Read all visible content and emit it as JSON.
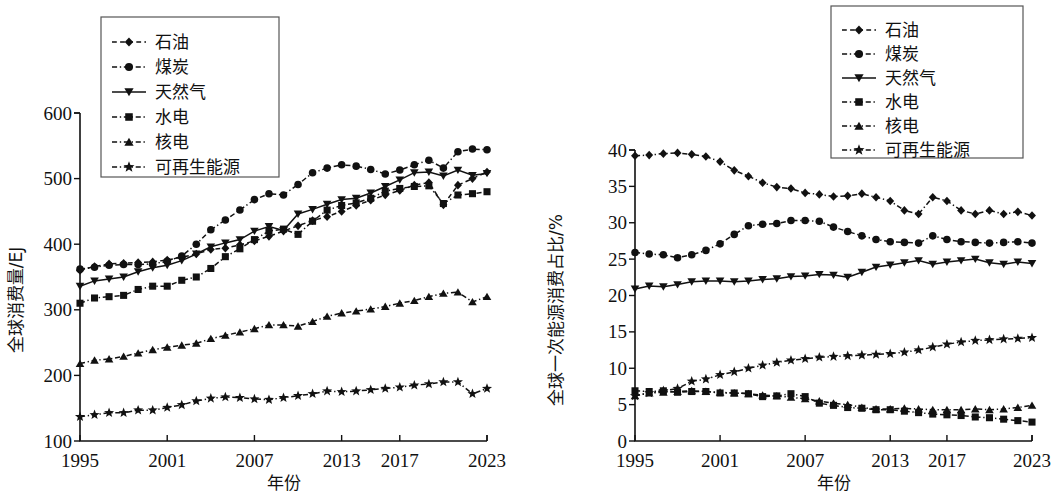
{
  "figure": {
    "panels": [
      "left",
      "right"
    ],
    "shared_xlabel": "年份",
    "xticks": [
      "1995",
      "2001",
      "2007",
      "2013",
      "2017",
      "2023"
    ],
    "series_names": [
      "石油",
      "煤炭",
      "天然气",
      "水电",
      "核电",
      "可再生能源"
    ],
    "marker_glyphs": [
      "diamond",
      "circle",
      "triangle-down",
      "square",
      "triangle-up",
      "star"
    ]
  },
  "legend": {
    "title": "",
    "items": [
      {
        "label": "石油",
        "marker": "diamond",
        "dash": "dashed"
      },
      {
        "label": "煤炭",
        "marker": "circle",
        "dash": "dashdot"
      },
      {
        "label": "天然气",
        "marker": "triangle-down",
        "dash": "solid"
      },
      {
        "label": "水电",
        "marker": "square",
        "dash": "dashdot"
      },
      {
        "label": "核电",
        "marker": "triangle-up",
        "dash": "dashdot"
      },
      {
        "label": "可再生能源",
        "marker": "star",
        "dash": "dashdot"
      }
    ]
  },
  "chart_data": [
    {
      "type": "line",
      "panel": "left",
      "title": "",
      "xlabel": "年份",
      "ylabel": "全球消费量/EJ",
      "xlim": [
        1995,
        2023
      ],
      "ylim": [
        100,
        600
      ],
      "yticks": [
        100,
        200,
        300,
        400,
        500,
        600
      ],
      "xticks": [
        1995,
        2001,
        2007,
        2013,
        2017,
        2023
      ],
      "grid": false,
      "legend_position": "top-left",
      "x": [
        1995,
        1996,
        1997,
        1998,
        1999,
        2000,
        2001,
        2002,
        2003,
        2004,
        2005,
        2006,
        2007,
        2008,
        2009,
        2010,
        2011,
        2012,
        2013,
        2014,
        2015,
        2016,
        2017,
        2018,
        2019,
        2020,
        2021,
        2022,
        2023
      ],
      "series": [
        {
          "name": "石油",
          "marker": "diamond",
          "dash": "dashed",
          "values": [
            360,
            366,
            370,
            371,
            372,
            373,
            376,
            380,
            385,
            392,
            394,
            399,
            405,
            412,
            420,
            428,
            436,
            442,
            450,
            459,
            467,
            475,
            482,
            490,
            494,
            460,
            490,
            500,
            510
          ]
        },
        {
          "name": "煤炭",
          "marker": "circle",
          "dash": "dashdot",
          "values": [
            362,
            365,
            368,
            369,
            369,
            370,
            374,
            382,
            400,
            422,
            437,
            452,
            468,
            477,
            475,
            491,
            509,
            516,
            521,
            519,
            514,
            507,
            513,
            521,
            528,
            516,
            541,
            545,
            544
          ]
        },
        {
          "name": "天然气",
          "marker": "triangle-down",
          "dash": "solid",
          "values": [
            336,
            344,
            347,
            350,
            358,
            364,
            368,
            375,
            385,
            396,
            402,
            407,
            420,
            427,
            421,
            446,
            453,
            461,
            468,
            470,
            478,
            488,
            498,
            509,
            510,
            504,
            513,
            505,
            508
          ]
        },
        {
          "name": "水电",
          "marker": "square",
          "dash": "dashdot",
          "values": [
            310,
            318,
            320,
            322,
            331,
            336,
            336,
            345,
            350,
            363,
            381,
            393,
            407,
            420,
            423,
            415,
            435,
            452,
            459,
            463,
            470,
            481,
            485,
            488,
            489,
            462,
            475,
            477,
            480
          ]
        },
        {
          "name": "核电",
          "marker": "triangle-up",
          "dash": "dashdot",
          "values": [
            218,
            223,
            225,
            229,
            234,
            239,
            243,
            246,
            249,
            256,
            261,
            266,
            271,
            277,
            277,
            275,
            282,
            290,
            295,
            298,
            301,
            305,
            310,
            314,
            320,
            325,
            327,
            312,
            320
          ]
        },
        {
          "name": "可再生能源",
          "marker": "star",
          "dash": "dashdot",
          "values": [
            137,
            140,
            143,
            143,
            147,
            147,
            151,
            155,
            161,
            165,
            167,
            166,
            164,
            163,
            166,
            169,
            172,
            176,
            175,
            176,
            178,
            180,
            182,
            185,
            187,
            190,
            190,
            172,
            180
          ]
        }
      ],
      "note_values_approx": true
    },
    {
      "type": "line",
      "panel": "right",
      "title": "",
      "xlabel": "年份",
      "ylabel": "全球一次能源消费占比/%",
      "xlim": [
        1995,
        2023
      ],
      "ylim": [
        0,
        40
      ],
      "yticks": [
        0,
        5,
        10,
        15,
        20,
        25,
        30,
        35,
        40
      ],
      "xticks": [
        1995,
        2001,
        2007,
        2013,
        2017,
        2023
      ],
      "grid": false,
      "legend_position": "top-right",
      "x": [
        1995,
        1996,
        1997,
        1998,
        1999,
        2000,
        2001,
        2002,
        2003,
        2004,
        2005,
        2006,
        2007,
        2008,
        2009,
        2010,
        2011,
        2012,
        2013,
        2014,
        2015,
        2016,
        2017,
        2018,
        2019,
        2020,
        2021,
        2022,
        2023
      ],
      "series": [
        {
          "name": "石油",
          "marker": "diamond",
          "dash": "dashdot",
          "values": [
            39.2,
            39.3,
            39.5,
            39.6,
            39.4,
            39.1,
            38.4,
            37.2,
            36.4,
            35.5,
            34.9,
            34.7,
            34.1,
            33.9,
            33.6,
            33.7,
            34.0,
            33.5,
            33.0,
            31.7,
            31.2,
            33.5,
            33.0,
            31.7,
            31.2,
            31.7,
            31.2,
            31.5,
            31.0
          ]
        },
        {
          "name": "煤炭",
          "marker": "circle",
          "dash": "dashdot",
          "values": [
            25.9,
            25.7,
            25.6,
            25.2,
            25.6,
            26.2,
            27.1,
            28.4,
            29.6,
            29.8,
            29.9,
            30.3,
            30.3,
            30.2,
            29.4,
            28.8,
            28.2,
            27.7,
            27.4,
            27.3,
            27.2,
            28.2,
            27.7,
            27.4,
            27.3,
            27.2,
            27.3,
            27.4,
            27.2
          ]
        },
        {
          "name": "天然气",
          "marker": "triangle-down",
          "dash": "solid",
          "values": [
            20.9,
            21.3,
            21.2,
            21.5,
            21.9,
            22.0,
            22.0,
            21.9,
            22.0,
            22.2,
            22.3,
            22.6,
            22.7,
            22.9,
            22.8,
            22.5,
            23.2,
            23.9,
            24.2,
            24.5,
            24.8,
            24.3,
            24.6,
            24.8,
            25.0,
            24.5,
            24.3,
            24.6,
            24.4
          ]
        },
        {
          "name": "水电",
          "marker": "square",
          "dash": "dashdot",
          "values": [
            6.9,
            6.8,
            6.9,
            6.7,
            6.8,
            6.8,
            6.6,
            6.6,
            6.5,
            6.1,
            6.2,
            6.5,
            6.1,
            5.2,
            4.9,
            4.6,
            4.5,
            4.3,
            4.3,
            4.1,
            3.9,
            3.7,
            3.6,
            3.5,
            3.3,
            3.2,
            3.0,
            2.8,
            2.6
          ]
        },
        {
          "name": "核电",
          "marker": "triangle-up",
          "dash": "dashdot",
          "values": [
            6.2,
            6.6,
            6.7,
            6.8,
            6.9,
            6.8,
            6.7,
            6.6,
            6.5,
            6.3,
            6.2,
            6.0,
            5.8,
            5.5,
            5.2,
            5.0,
            4.6,
            4.4,
            4.4,
            4.5,
            4.4,
            4.3,
            4.3,
            4.3,
            4.4,
            4.3,
            4.4,
            4.6,
            4.9
          ]
        },
        {
          "name": "可再生能源",
          "marker": "star",
          "dash": "dashdot",
          "values": [
            6.2,
            6.6,
            6.9,
            7.2,
            8.2,
            8.5,
            9.1,
            9.5,
            10.0,
            10.4,
            10.8,
            11.1,
            11.3,
            11.5,
            11.6,
            11.7,
            11.8,
            11.9,
            12.0,
            12.2,
            12.5,
            12.9,
            13.3,
            13.6,
            13.8,
            13.9,
            14.0,
            14.1,
            14.2
          ]
        }
      ],
      "note_values_approx": true
    }
  ]
}
